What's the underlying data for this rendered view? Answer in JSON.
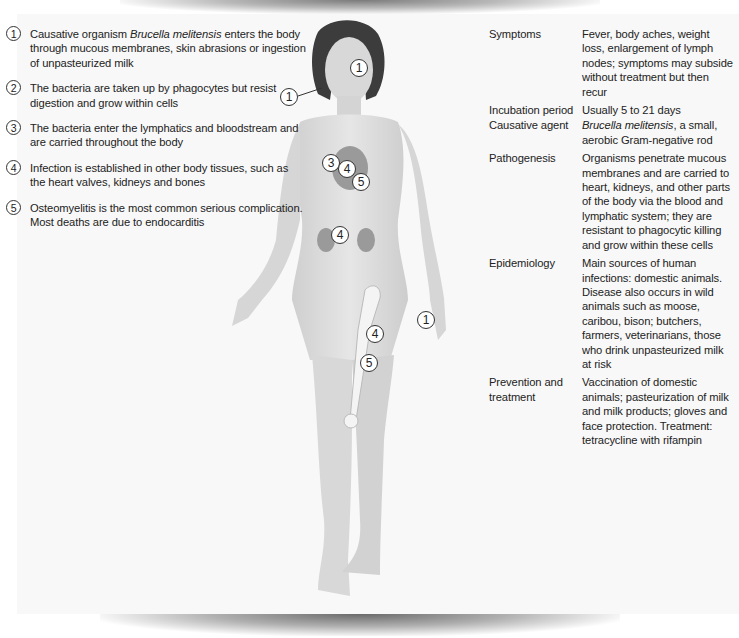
{
  "steps": [
    {
      "num": "1",
      "text_pre": "Causative organism ",
      "text_italic": "Brucella melitensis",
      "text_post": " enters the body through mucous membranes, skin abrasions or ingestion of unpasteurized milk"
    },
    {
      "num": "2",
      "text": "The bacteria are taken up by phagocytes but resist digestion and grow within cells"
    },
    {
      "num": "3",
      "text": "The bacteria enter the lymphatics and bloodstream and are carried throughout the body"
    },
    {
      "num": "4",
      "text": "Infection is established in other body tissues, such as the heart valves, kidneys and bones"
    },
    {
      "num": "5",
      "text": "Osteomyelitis is the most common serious complication. Most deaths are due to endocarditis"
    }
  ],
  "facts": [
    {
      "label": "Symptoms",
      "value": "Fever, body aches, weight loss, enlargement of lymph nodes; symptoms may subside without treatment but then recur"
    },
    {
      "label": "Incubation period",
      "value": "Usually 5 to 21 days"
    },
    {
      "label": "Causative agent",
      "value_italic": "Brucella melitensis",
      "value_post": ", a small, aerobic Gram-negative rod"
    },
    {
      "label": "Pathogenesis",
      "value": "Organisms penetrate mucous membranes and are carried to heart, kidneys, and other parts of the body via the blood and lymphatic system; they are resistant to phagocytic killing and grow within these cells"
    },
    {
      "label": "Epidemiology",
      "value": "Main sources of human infections: domestic animals. Disease also occurs in wild animals such as moose, caribou, bison; butchers, farmers, veterinarians, those who drink unpasteurized milk at risk"
    },
    {
      "label": "Prevention and treatment",
      "value": "Vaccination of domestic animals; pasteurization of milk and milk products; gloves and face protection. Treatment: tetracycline with rifampin"
    }
  ],
  "markers": [
    {
      "num": "1",
      "site": "cheek"
    },
    {
      "num": "1",
      "site": "mouth"
    },
    {
      "num": "3",
      "site": "heart"
    },
    {
      "num": "4",
      "site": "heart"
    },
    {
      "num": "5",
      "site": "heart"
    },
    {
      "num": "4",
      "site": "kidneys"
    },
    {
      "num": "4",
      "site": "femur"
    },
    {
      "num": "5",
      "site": "femur"
    },
    {
      "num": "1",
      "site": "hand"
    }
  ],
  "colors": {
    "panel": "#f8f8f8",
    "skin": "#dcdcdc",
    "hair": "#3a3a3a",
    "organ": "#9a9a9a"
  }
}
